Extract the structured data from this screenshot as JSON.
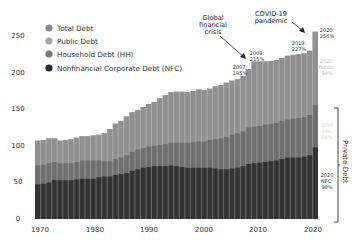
{
  "chart_data": {
    "type": "area",
    "stacked": true,
    "title": "",
    "xlabel": "",
    "ylabel": "",
    "ylim": [
      0,
      260
    ],
    "xlim": [
      1970,
      2020
    ],
    "yticks": [
      0,
      50,
      100,
      150,
      200,
      250
    ],
    "xticks": [
      1970,
      1980,
      1990,
      2000,
      2010,
      2020
    ],
    "grid": false,
    "legend_position": "top-left",
    "x": [
      1970,
      1971,
      1972,
      1973,
      1974,
      1975,
      1976,
      1977,
      1978,
      1979,
      1980,
      1981,
      1982,
      1983,
      1984,
      1985,
      1986,
      1987,
      1988,
      1989,
      1990,
      1991,
      1992,
      1993,
      1994,
      1995,
      1996,
      1997,
      1998,
      1999,
      2000,
      2001,
      2002,
      2003,
      2004,
      2005,
      2006,
      2007,
      2008,
      2009,
      2010,
      2011,
      2012,
      2013,
      2014,
      2015,
      2016,
      2017,
      2018,
      2019,
      2020
    ],
    "series": [
      {
        "name": "Nonfinancial Corporate Debt (NFC)",
        "color": "#2e2e2e",
        "values": [
          47,
          48,
          50,
          53,
          53,
          53,
          53,
          54,
          55,
          55,
          55,
          57,
          58,
          58,
          60,
          61,
          63,
          66,
          68,
          70,
          71,
          72,
          72,
          72,
          73,
          72,
          71,
          70,
          70,
          70,
          70,
          70,
          69,
          68,
          68,
          69,
          70,
          72,
          75,
          76,
          77,
          78,
          79,
          80,
          82,
          84,
          84,
          84,
          85,
          87,
          98
        ]
      },
      {
        "name": "Household Debt (HH)",
        "color": "#6e6e6e",
        "values": [
          26,
          26,
          26,
          25,
          23,
          23,
          23,
          24,
          25,
          25,
          25,
          23,
          21,
          21,
          22,
          23,
          24,
          26,
          27,
          27,
          28,
          28,
          29,
          30,
          31,
          32,
          33,
          34,
          35,
          36,
          36,
          38,
          40,
          42,
          44,
          46,
          47,
          48,
          50,
          50,
          50,
          51,
          51,
          51,
          52,
          52,
          53,
          54,
          54,
          55,
          58
        ]
      },
      {
        "name": "Public Debt",
        "color": "#8e8e8e",
        "values": [
          34,
          34,
          34,
          32,
          31,
          32,
          33,
          33,
          33,
          33,
          34,
          35,
          38,
          44,
          48,
          50,
          53,
          54,
          54,
          56,
          58,
          60,
          64,
          67,
          69,
          70,
          70,
          69,
          70,
          71,
          70,
          70,
          72,
          73,
          74,
          74,
          74,
          75,
          80,
          89,
          88,
          86,
          86,
          86,
          86,
          87,
          87,
          87,
          87,
          88,
          99
        ]
      }
    ],
    "total": {
      "name": "Total Debt",
      "color": "#9a9a9a",
      "values": [
        107,
        108,
        110,
        110,
        107,
        108,
        109,
        111,
        113,
        113,
        114,
        115,
        117,
        123,
        130,
        134,
        140,
        146,
        149,
        153,
        157,
        160,
        165,
        169,
        173,
        174,
        174,
        173,
        175,
        177,
        176,
        178,
        181,
        183,
        186,
        189,
        191,
        195,
        205,
        215,
        215,
        215,
        216,
        217,
        220,
        223,
        224,
        225,
        226,
        230,
        256
      ]
    },
    "annotations": [
      {
        "text": "Global financial crisis",
        "points_to": 2008
      },
      {
        "text": "2007: 195%",
        "x": 2007,
        "y": 195
      },
      {
        "text": "2009: 215%",
        "x": 2009,
        "y": 215
      },
      {
        "text": "COVID-19 pandemic",
        "points_to": 2020
      },
      {
        "text": "2019: 227%",
        "x": 2019,
        "y": 227
      },
      {
        "text": "2020: 256%",
        "x": 2020,
        "y": 256
      },
      {
        "text": "2020: Public: 99%"
      },
      {
        "text": "2020: HH: 58%"
      },
      {
        "text": "2020: NFC: 98%"
      },
      {
        "text": "Private Debt",
        "bracket": "HH + NFC"
      }
    ]
  },
  "legend": {
    "items": [
      {
        "label": "Total Debt",
        "color": "#8a8a8a"
      },
      {
        "label": "Public Debt",
        "color": "#a6a6a6"
      },
      {
        "label": "Household Debt (HH)",
        "color": "#7a7a7a"
      },
      {
        "label": "Nonfinancial Corporate Debt (NFC)",
        "color": "#2b2b2b"
      }
    ]
  },
  "axes": {
    "y_ticks": [
      "0",
      "50",
      "100",
      "150",
      "200",
      "250"
    ],
    "x_ticks": [
      "1970",
      "1980",
      "1990",
      "2000",
      "2010",
      "2020"
    ]
  },
  "annotations": {
    "gfc": [
      "Global",
      "financial",
      "crisis"
    ],
    "covid": [
      "COVID-19",
      "pandemic"
    ],
    "y2007": [
      "2007:",
      "195%"
    ],
    "y2009": [
      "2009:",
      "215%"
    ],
    "y2019": [
      "2019:",
      "227%"
    ],
    "y2020": [
      "2020:",
      "256%"
    ],
    "public2020": [
      "2020:",
      "Public:",
      "99%"
    ],
    "hh2020": [
      "2020",
      "HH:",
      "58%"
    ],
    "nfc2020": [
      "2020",
      "NFC:",
      "98%"
    ],
    "private_debt": "Private Debt"
  }
}
